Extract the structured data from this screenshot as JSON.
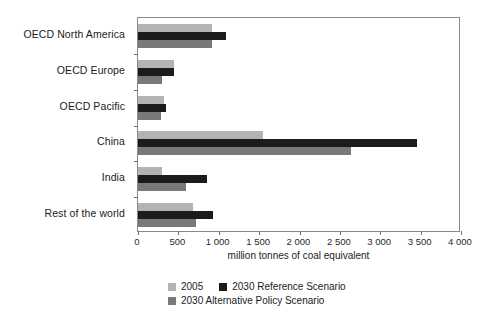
{
  "chart_data": {
    "type": "bar",
    "orientation": "horizontal",
    "title": "",
    "xlabel": "million tonnes of coal equivalent",
    "ylabel": "",
    "xlim": [
      0,
      4000
    ],
    "xticks": [
      0,
      500,
      1000,
      1500,
      2000,
      2500,
      3000,
      3500,
      4000
    ],
    "xticklabels": [
      "0",
      "500",
      "1 000",
      "1 500",
      "2 000",
      "2 500",
      "3 000",
      "3 500",
      "4 000"
    ],
    "grid": false,
    "legend_position": "bottom",
    "categories": [
      "OECD North America",
      "OECD Europe",
      "OECD Pacific",
      "China",
      "India",
      "Rest of the world"
    ],
    "series": [
      {
        "name": "2005",
        "color": "#b3b3b3",
        "values": [
          915,
          450,
          320,
          1550,
          300,
          680
        ]
      },
      {
        "name": "2030 Reference Scenario",
        "color": "#1c1c1c",
        "values": [
          1090,
          440,
          345,
          3455,
          860,
          930
        ]
      },
      {
        "name": "2030 Alternative Policy Scenario",
        "color": "#797979",
        "values": [
          915,
          300,
          290,
          2640,
          590,
          720
        ]
      }
    ]
  },
  "axis": {
    "title": "million tonnes of coal equivalent"
  },
  "legend": {
    "items": [
      {
        "label": "2005",
        "color": "#b3b3b3"
      },
      {
        "label": "2030 Reference Scenario",
        "color": "#1c1c1c"
      },
      {
        "label": "2030 Alternative Policy Scenario",
        "color": "#797979"
      }
    ]
  }
}
